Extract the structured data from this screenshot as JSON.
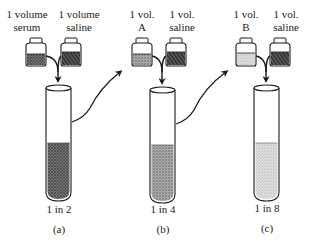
{
  "figure": {
    "panels": [
      {
        "id": "a",
        "left_bottle_label": [
          "1 volume",
          "serum"
        ],
        "right_bottle_label": [
          "1 volume",
          "saline"
        ],
        "dilution": "1 in 2",
        "caption": "(a)"
      },
      {
        "id": "b",
        "left_bottle_label": [
          "1 vol.",
          "A"
        ],
        "right_bottle_label": [
          "1 vol.",
          "saline"
        ],
        "dilution": "1 in 4",
        "caption": "(b)"
      },
      {
        "id": "c",
        "left_bottle_label": [
          "1 vol.",
          "B"
        ],
        "right_bottle_label": [
          "1 vol.",
          "saline"
        ],
        "dilution": "1 in 8",
        "caption": "(c)"
      }
    ],
    "colors": {
      "ink": "#1a1a1a",
      "liquid_a": "#555555",
      "liquid_b": "#8a8a8a",
      "liquid_c": "#c4c4c4"
    }
  }
}
